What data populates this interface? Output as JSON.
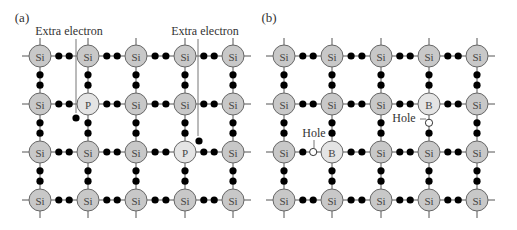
{
  "panels": [
    {
      "id": "a",
      "label": "(a)",
      "label_pos": [
        22,
        22
      ],
      "columns_x": [
        40,
        88,
        136,
        185,
        233
      ],
      "rows_y": [
        56,
        104,
        152,
        200
      ],
      "grid": [
        [
          "Si",
          "Si",
          "Si",
          "Si",
          "Si"
        ],
        [
          "Si",
          "P",
          "Si",
          "Si",
          "Si"
        ],
        [
          "Si",
          "Si",
          "Si",
          "P",
          "Si"
        ],
        [
          "Si",
          "Si",
          "Si",
          "Si",
          "Si"
        ]
      ],
      "annotations": [
        {
          "text": "Extra electron",
          "text_x": 69,
          "text_y": 35,
          "line_x": 76,
          "line_y1": 39,
          "line_y2": 113,
          "dot": [
            76,
            118
          ]
        },
        {
          "text": "Extra electron",
          "text_x": 205,
          "text_y": 35,
          "line_x": 198,
          "line_y1": 39,
          "line_y2": 136,
          "dot": [
            199,
            141
          ]
        }
      ],
      "holes": []
    },
    {
      "id": "b",
      "label": "(b)",
      "label_pos": [
        269,
        22
      ],
      "columns_x": [
        284,
        332,
        381,
        429,
        477
      ],
      "rows_y": [
        56,
        104,
        152,
        200
      ],
      "grid": [
        [
          "Si",
          "Si",
          "Si",
          "Si",
          "Si"
        ],
        [
          "Si",
          "Si",
          "Si",
          "B",
          "Si"
        ],
        [
          "Si",
          "B",
          "Si",
          "Si",
          "Si"
        ],
        [
          "Si",
          "Si",
          "Si",
          "Si",
          "Si"
        ]
      ],
      "annotations": [],
      "holes": [
        {
          "label": "Hole",
          "row": 2,
          "col_gap": 0,
          "position": "horizontal-second",
          "label_x": 314,
          "label_y": 137,
          "leader": "vertical"
        },
        {
          "label": "Hole",
          "row_gap": 1,
          "col": 3,
          "position": "vertical-first",
          "label_x": 404,
          "label_y": 122,
          "leader": "horizontal"
        }
      ]
    }
  ],
  "legend": {
    "dopant_colors": {
      "Si": "#c8c8c8",
      "P": "#e4e4e4",
      "B": "#e4e4e4"
    },
    "bond_color": "#555555",
    "electron_color": "#000000",
    "hole_fill": "#ffffff"
  }
}
